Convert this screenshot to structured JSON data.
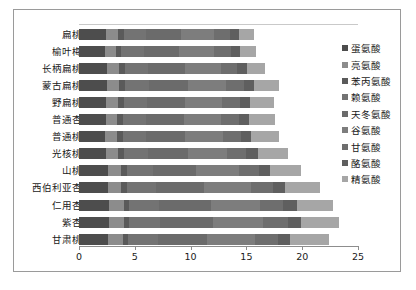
{
  "chart_data": {
    "type": "bar",
    "orientation": "horizontal",
    "stacked": true,
    "title": "",
    "xlabel": "",
    "ylabel": "",
    "xlim": [
      0,
      25
    ],
    "xticks": [
      0,
      5,
      10,
      15,
      20,
      25
    ],
    "xtick_labels": [
      "0",
      "5",
      "10",
      "15",
      "20",
      "25"
    ],
    "grid": false,
    "legend_position": "right",
    "categories": [
      "扁桃",
      "榆叶梅",
      "长柄扁桃",
      "蒙古扁桃",
      "野扁桃",
      "普通杏",
      "普通桃",
      "光核桃",
      "山桃",
      "西伯利亚杏",
      "仁用杏",
      "紫杏",
      "甘肃桃"
    ],
    "series": [
      {
        "name": "蛋氨酸",
        "color": "#4d4d4d",
        "values": [
          2.4,
          2.3,
          2.5,
          2.5,
          2.4,
          2.4,
          2.3,
          2.4,
          2.6,
          2.6,
          2.7,
          2.7,
          2.6
        ]
      },
      {
        "name": "亮氨酸",
        "color": "#8c8c8c",
        "values": [
          1.1,
          1.0,
          1.1,
          1.1,
          1.1,
          1.0,
          1.1,
          1.1,
          1.2,
          1.2,
          1.3,
          1.3,
          1.3
        ]
      },
      {
        "name": "苯丙氨酸",
        "color": "#5a5a5a",
        "values": [
          0.5,
          0.5,
          0.5,
          0.5,
          0.5,
          0.5,
          0.5,
          0.5,
          0.5,
          0.5,
          0.5,
          0.5,
          0.5
        ]
      },
      {
        "name": "赖氨酸",
        "color": "#737373",
        "values": [
          2.0,
          2.0,
          2.1,
          2.2,
          2.1,
          2.1,
          2.1,
          2.2,
          2.3,
          2.6,
          2.7,
          2.8,
          2.7
        ]
      },
      {
        "name": "天冬氨酸",
        "color": "#6b6b6b",
        "values": [
          3.1,
          3.2,
          3.3,
          3.5,
          3.4,
          3.4,
          3.5,
          3.6,
          3.9,
          4.3,
          4.6,
          4.7,
          4.4
        ]
      },
      {
        "name": "谷氨酸",
        "color": "#7d7d7d",
        "values": [
          3.0,
          3.1,
          3.2,
          3.4,
          3.3,
          3.3,
          3.4,
          3.5,
          3.8,
          4.2,
          4.4,
          4.5,
          4.3
        ]
      },
      {
        "name": "甘氨酸",
        "color": "#6e6e6e",
        "values": [
          1.4,
          1.5,
          1.5,
          1.6,
          1.6,
          1.6,
          1.6,
          1.7,
          1.8,
          2.0,
          2.1,
          2.2,
          2.0
        ]
      },
      {
        "name": "酪氨酸",
        "color": "#5f5f5f",
        "values": [
          0.8,
          0.8,
          0.9,
          0.9,
          0.9,
          0.9,
          0.9,
          1.0,
          1.0,
          1.1,
          1.2,
          1.2,
          1.1
        ]
      },
      {
        "name": "精氨酸",
        "color": "#a6a6a6",
        "values": [
          1.4,
          1.5,
          1.6,
          2.2,
          2.2,
          2.4,
          2.5,
          2.7,
          2.8,
          3.1,
          3.3,
          3.4,
          3.5
        ]
      }
    ]
  }
}
